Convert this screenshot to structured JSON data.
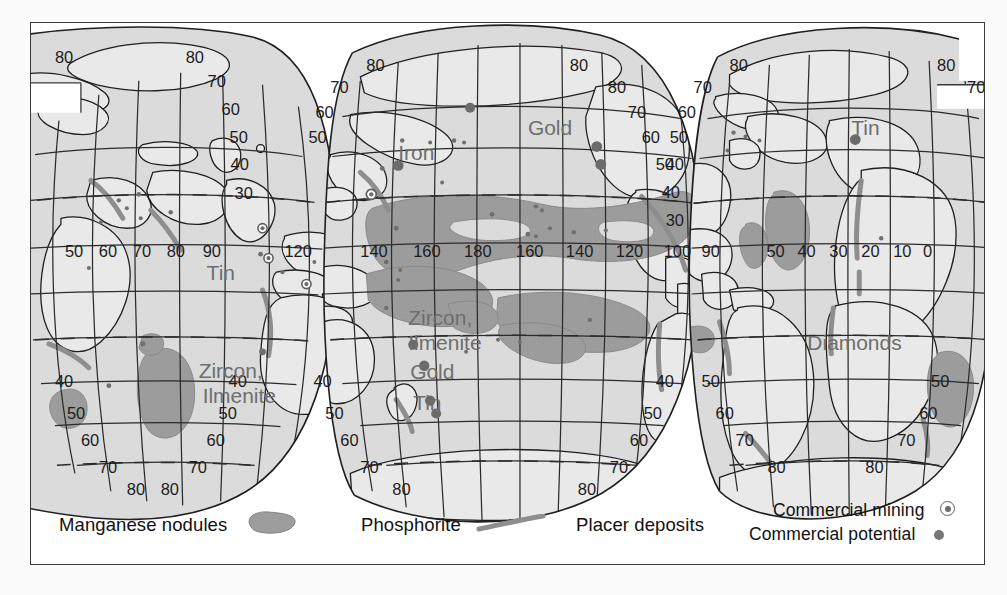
{
  "figure": {
    "type": "interrupted-world-map",
    "projection": "interrupted equal-area (Goode homolosine style), three lobes"
  },
  "colors": {
    "ocean_fill": "#dcdcdc",
    "land_fill": "#e9e9e9",
    "manganese_fill": "#9d9d9d",
    "phosphorite_stroke": "#8e8e8e",
    "placer_dot": "#6f6f6f",
    "graticule": "#2b2b2b",
    "coastline": "#1f1f1f",
    "map_label_text": "#6e6e6e",
    "frame": "#3a3a3a",
    "legend_text": "#111111"
  },
  "legend": {
    "entries": [
      {
        "id": "manganese-nodules",
        "label": "Manganese nodules",
        "symbol": "blob-swatch"
      },
      {
        "id": "phosphorite",
        "label": "Phosphorite",
        "symbol": "curved-line-swatch"
      },
      {
        "id": "placer-deposits",
        "label": "Placer deposits",
        "symbol": "none"
      },
      {
        "id": "commercial-mining",
        "label": "Commercial mining",
        "symbol": "ringed-dot"
      },
      {
        "id": "commercial-potential",
        "label": "Commercial potential",
        "symbol": "solid-dot"
      }
    ]
  },
  "map_labels": [
    {
      "text": "Iron",
      "lobe": "center",
      "x": 400,
      "y": 158
    },
    {
      "text": "Gold",
      "lobe": "center",
      "x": 527,
      "y": 131
    },
    {
      "text": "Zircon,",
      "lobe": "center",
      "x": 402,
      "y": 323
    },
    {
      "text": "Ilmenite",
      "lobe": "center",
      "x": 405,
      "y": 348
    },
    {
      "text": "Gold",
      "lobe": "center",
      "x": 405,
      "y": 377
    },
    {
      "text": "Tin",
      "lobe": "center",
      "x": 408,
      "y": 408
    },
    {
      "text": "Tin",
      "lobe": "left",
      "x": 206,
      "y": 277
    },
    {
      "text": "Zircon,",
      "lobe": "left",
      "x": 200,
      "y": 376
    },
    {
      "text": "Ilmenite",
      "lobe": "left",
      "x": 203,
      "y": 400
    },
    {
      "text": "Tin",
      "lobe": "right",
      "x": 851,
      "y": 131
    },
    {
      "text": "Diamonds",
      "lobe": "right",
      "x": 828,
      "y": 347
    }
  ],
  "graticule_labels": {
    "left_lobe": {
      "latitudes_left_edge": [
        "80",
        "40",
        "50",
        "60",
        "70",
        "80"
      ],
      "latitudes_right_edge": [
        "80",
        "70",
        "60",
        "50",
        "40",
        "30",
        "30",
        "40",
        "50",
        "60",
        "70",
        "80"
      ],
      "longitudes_equator": [
        "50",
        "60",
        "70",
        "80",
        "90",
        "120"
      ]
    },
    "center_lobe": {
      "latitudes_left_edge": [
        "80",
        "70",
        "60",
        "50",
        "40",
        "50",
        "60",
        "70",
        "80"
      ],
      "latitudes_right_edge": [
        "80",
        "70",
        "60",
        "50",
        "40",
        "30",
        "30",
        "40",
        "50",
        "60",
        "70",
        "80"
      ],
      "longitudes_equator": [
        "140",
        "160",
        "180",
        "160",
        "140",
        "120",
        "100",
        "90"
      ]
    },
    "right_lobe": {
      "latitudes_left_edge": [
        "80",
        "70",
        "60",
        "50",
        "40",
        "50",
        "60",
        "70",
        "80"
      ],
      "latitudes_right_edge": [
        "80",
        "70",
        "70",
        "50",
        "60",
        "70",
        "80"
      ],
      "longitudes_equator": [
        "50",
        "40",
        "30",
        "20",
        "10",
        "0"
      ]
    }
  }
}
